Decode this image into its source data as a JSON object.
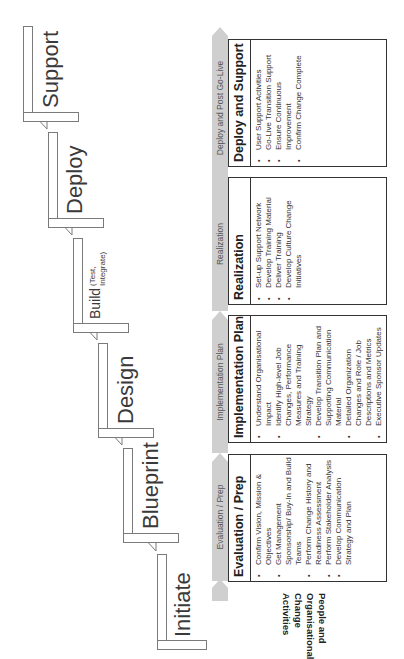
{
  "stages": [
    {
      "name": "Initiate"
    },
    {
      "name": "Blueprint"
    },
    {
      "name": "Design"
    },
    {
      "name": "Build",
      "sub": "(Test, Integrate)"
    },
    {
      "name": "Deploy"
    },
    {
      "name": "Support"
    }
  ],
  "phases": [
    "Evaluation / Prep",
    "Implementation Plan",
    "Realization",
    "Deploy and Post Go-Live"
  ],
  "row_label": "People and Organisational Change Activities",
  "boxes": [
    {
      "title": "Evaluation / Prep",
      "items": [
        "Confirm Vision, Mission & Objectives",
        "Get Management Sponsorship/ Buy-In and Build Teams",
        "Perform Change History and Readiness Assessment",
        "Perform Stakeholder Analysis",
        "Develop Communication Strategy and Plan"
      ]
    },
    {
      "title": "Implementation Plan",
      "items": [
        "Understand Organisational Impact",
        "Identify High-level Job Changes, Performance Measures and Training Strategy",
        "Develop Transition Plan and Supporting Communication Material",
        "Detailed Organization Changes and Role / Job Descriptions and Metrics",
        "Executive Sponsor Updates"
      ]
    },
    {
      "title": "Realization",
      "items": [
        "Set-up Support Network",
        "Develop Training Material",
        "Deliver Training",
        "Develop Culture Change Initiatives"
      ]
    },
    {
      "title": "Deploy and Support",
      "items": [
        "User Support Activities",
        "Go-Live Transition Support",
        "Ensure Continuous Improvement",
        "Confirm Change Complete"
      ]
    }
  ],
  "colors": {
    "arrow_fill": "#cfcfcf",
    "stair_line": "#7a7a7a",
    "box_border": "#333333",
    "text": "#333333"
  }
}
